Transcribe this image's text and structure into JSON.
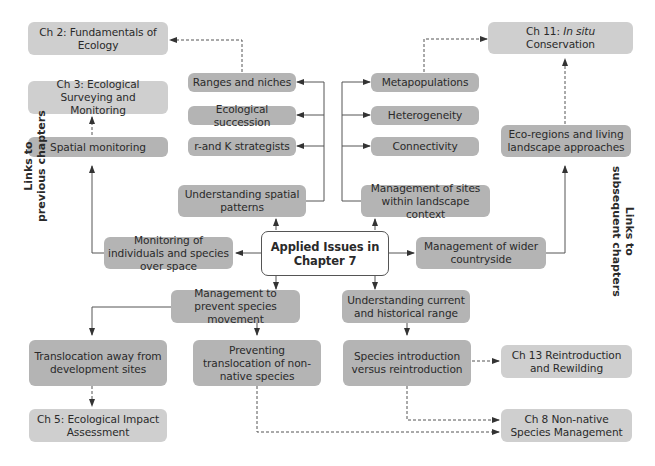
{
  "center": {
    "line1": "Applied Issues in",
    "line2": "Chapter 7"
  },
  "side_labels": {
    "previous": {
      "line1": "Links to",
      "line2": "previous chapters"
    },
    "subsequent": {
      "line1": "Links to",
      "line2": "subsequent chapters"
    }
  },
  "chapters": {
    "ch2": "Ch 2:  Fundamentals of Ecology",
    "ch3": "Ch 3:  Ecological Surveying and Monitoring",
    "ch5": "Ch 5: Ecological Impact Assessment",
    "ch8": "Ch 8 Non-native Species Management",
    "ch11_prefix": "Ch 11: ",
    "ch11_italic": "In situ",
    "ch11_suffix": " Conservation",
    "ch13": "Ch 13 Reintroduction and Rewilding"
  },
  "topics": {
    "spatial_monitoring": "Spatial monitoring",
    "ranges_niches": "Ranges and niches",
    "ecological_succession": "Ecological succession",
    "rk_strategists": "r-and K strategists",
    "understanding_spatial": "Understanding spatial patterns",
    "metapopulations": "Metapopulations",
    "heterogeneity": "Heterogeneity",
    "connectivity": "Connectivity",
    "management_sites": "Management of sites within landscape context",
    "eco_regions": "Eco-regions and living landscape approaches",
    "monitoring_individuals": "Monitoring of individuals and species over space",
    "management_wider": "Management of wider countryside",
    "management_prevent": "Management to prevent species movement",
    "understanding_range": "Understanding current and historical range",
    "translocation_away": "Translocation away from development sites",
    "preventing_translocation": "Preventing translocation of non-native species",
    "species_introduction": "Species introduction versus reintroduction"
  },
  "colors": {
    "topic_fill": "#b4b4b4",
    "chapter_fill": "#cfcfcf",
    "line": "#444444"
  }
}
